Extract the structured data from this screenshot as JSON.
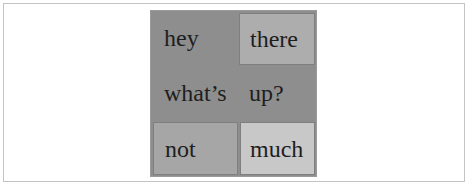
{
  "table": {
    "rows": [
      {
        "cells": [
          {
            "text": "hey"
          },
          {
            "text": "there"
          }
        ]
      },
      {
        "cells": [
          {
            "text": "what’s"
          },
          {
            "text": "up?"
          }
        ]
      },
      {
        "cells": [
          {
            "text": "not"
          },
          {
            "text": "much"
          }
        ]
      }
    ]
  },
  "colors": {
    "table_background": "#8e8e8e",
    "cell_there": "#adadad",
    "cell_not": "#a6a6a6",
    "cell_much": "#c8c8c8",
    "text": "#1e1e1e"
  }
}
